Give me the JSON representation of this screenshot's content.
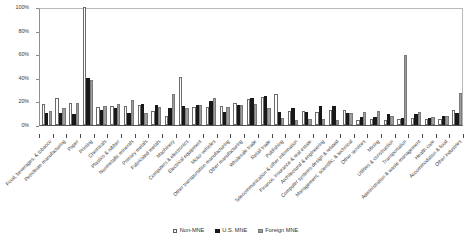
{
  "chart_data": {
    "type": "bar",
    "title": "",
    "subtitle": "",
    "xlabel": "",
    "ylabel": "",
    "ylim": [
      0,
      100
    ],
    "grid": false,
    "legend_position": "bottom",
    "y_ticks": [
      "0%",
      "20%",
      "40%",
      "60%",
      "80%",
      "100%"
    ],
    "y_tick_values": [
      0,
      20,
      40,
      60,
      80,
      100
    ],
    "categories": [
      "Food, beverages, & tobacco",
      "Petroleum manufacturing",
      "Paper",
      "Printing",
      "Chemicals",
      "Plastics & rubber",
      "Nonmetallic minerals",
      "Primary metals",
      "Fabricated metals",
      "Machinery",
      "Computers & electronics",
      "Electrical equipment",
      "Motor vehicles",
      "Other transportation manufacturing",
      "Other manufacturing",
      "Wholesale trade",
      "Retail trade",
      "Publishing",
      "Telecommunication & other information",
      "Finance, insurance & real estate",
      "Architectural & engineering",
      "Computer systems design & related",
      "Management, scientific, & technical",
      "Other services",
      "Mining",
      "Utilities & construction",
      "Transportation",
      "Administration & waste management",
      "Health care",
      "Accommodation & food",
      "Other industries"
    ],
    "series": [
      {
        "name": "Non-MNE",
        "color": "#ffffff",
        "values": [
          18,
          23,
          19,
          100,
          15,
          16,
          16,
          17,
          12,
          8,
          41,
          15,
          15,
          16,
          19,
          22,
          24,
          26,
          12,
          12,
          11,
          13,
          13,
          4,
          5,
          4,
          5,
          6,
          5,
          5,
          13
        ]
      },
      {
        "name": "U.S. MNE",
        "color": "#181818",
        "values": [
          10,
          10,
          9,
          40,
          13,
          14,
          10,
          18,
          17,
          14,
          16,
          17,
          20,
          11,
          17,
          23,
          25,
          11,
          14,
          11,
          16,
          16,
          10,
          7,
          7,
          9,
          6,
          9,
          6,
          8,
          10
        ]
      },
      {
        "name": "Foreign MNE",
        "color": "#9d9d9d",
        "values": [
          12,
          14,
          19,
          38,
          16,
          18,
          21,
          10,
          15,
          26,
          14,
          17,
          23,
          15,
          17,
          18,
          14,
          6,
          4,
          5,
          5,
          4,
          10,
          11,
          12,
          8,
          59,
          11,
          7,
          8,
          27
        ]
      }
    ]
  },
  "legend": {
    "items": [
      {
        "label": "Non-MNE",
        "swatch": "white-square-swatch"
      },
      {
        "label": "U.S. MNE",
        "swatch": "black-square-swatch"
      },
      {
        "label": "Foreign MNE",
        "swatch": "gray-square-swatch"
      }
    ]
  }
}
